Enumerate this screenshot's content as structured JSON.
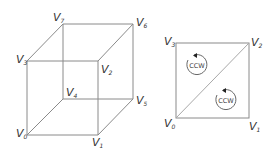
{
  "diagram": {
    "cube": {
      "vertices": [
        {
          "id": "v0",
          "label": "V",
          "sub": "0",
          "x": 27,
          "y": 135
        },
        {
          "id": "v1",
          "label": "V",
          "sub": "1",
          "x": 98,
          "y": 135
        },
        {
          "id": "v2",
          "label": "V",
          "sub": "2",
          "x": 99,
          "y": 61
        },
        {
          "id": "v3",
          "label": "V",
          "sub": "3",
          "x": 27,
          "y": 61
        },
        {
          "id": "v4",
          "label": "V",
          "sub": "4",
          "x": 63,
          "y": 99
        },
        {
          "id": "v5",
          "label": "V",
          "sub": "5",
          "x": 134,
          "y": 99
        },
        {
          "id": "v6",
          "label": "V",
          "sub": "6",
          "x": 133,
          "y": 25
        },
        {
          "id": "v7",
          "label": "V",
          "sub": "7",
          "x": 63,
          "y": 24
        }
      ]
    },
    "square": {
      "vertices": [
        {
          "id": "v0",
          "label": "V",
          "sub": "0"
        },
        {
          "id": "v1",
          "label": "V",
          "sub": "1"
        },
        {
          "id": "v2",
          "label": "V",
          "sub": "2"
        },
        {
          "id": "v3",
          "label": "V",
          "sub": "3"
        }
      ],
      "winding": [
        {
          "label": "CCW",
          "triangle": "upper-left"
        },
        {
          "label": "CCW",
          "triangle": "lower-right"
        }
      ]
    },
    "colors": {
      "edge": "#8a8a8a",
      "text": "#333333"
    }
  }
}
